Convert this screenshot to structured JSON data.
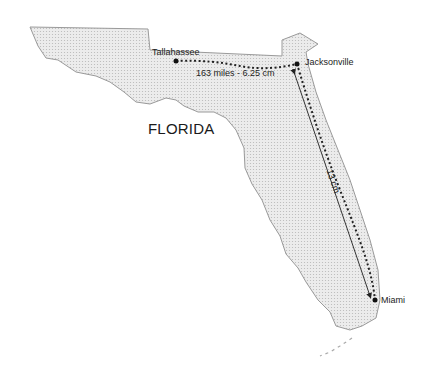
{
  "map": {
    "state_label": "FLORIDA",
    "cities": [
      {
        "name": "Tallahassee",
        "x": 176,
        "y": 61
      },
      {
        "name": "Jacksonville",
        "x": 297,
        "y": 64
      },
      {
        "name": "Miami",
        "x": 375,
        "y": 300
      }
    ],
    "routes": [
      {
        "from": "Tallahassee",
        "to": "Jacksonville",
        "label": "163 miles - 6.25 cm",
        "style": "dotted"
      },
      {
        "from": "Jacksonville",
        "to": "Miami",
        "label": "13 cm",
        "style": "solid-arrow"
      },
      {
        "from": "Jacksonville",
        "to": "Miami",
        "label": "",
        "style": "dotted"
      }
    ],
    "colors": {
      "land": "#e6e6e6",
      "outline": "#9a9a9a",
      "route": "#222222",
      "text": "#222222"
    }
  }
}
